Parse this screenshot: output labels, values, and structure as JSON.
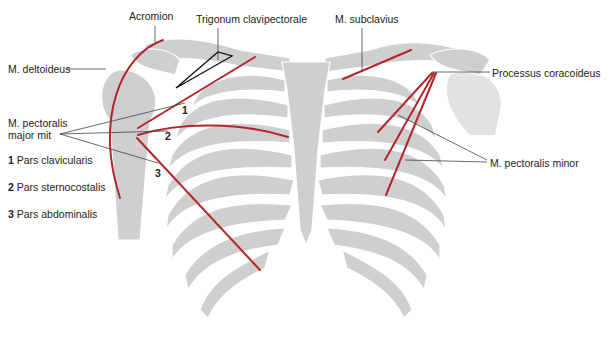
{
  "figure": {
    "colors": {
      "bone": "#cfcfcf",
      "muscle": "#b3262a",
      "leader": "#444444",
      "background": "#ffffff"
    }
  },
  "labels": {
    "acromion": "Acromion",
    "trigonum": "Trigonum clavipectorale",
    "subclavius": "M. subclavius",
    "deltoideus": "M. deltoideus",
    "coracoideus": "Processus coracoideus",
    "pectoralis_major_line1": "M. pectoralis",
    "pectoralis_major_line2": "major mit",
    "pectoralis_minor": "M. pectoralis minor",
    "marker_1": "1",
    "marker_2": "2",
    "marker_3": "3"
  },
  "legend": [
    {
      "num": "1",
      "text": "Pars clavicularis"
    },
    {
      "num": "2",
      "text": "Pars sternocostalis"
    },
    {
      "num": "3",
      "text": "Pars abdominalis"
    }
  ]
}
